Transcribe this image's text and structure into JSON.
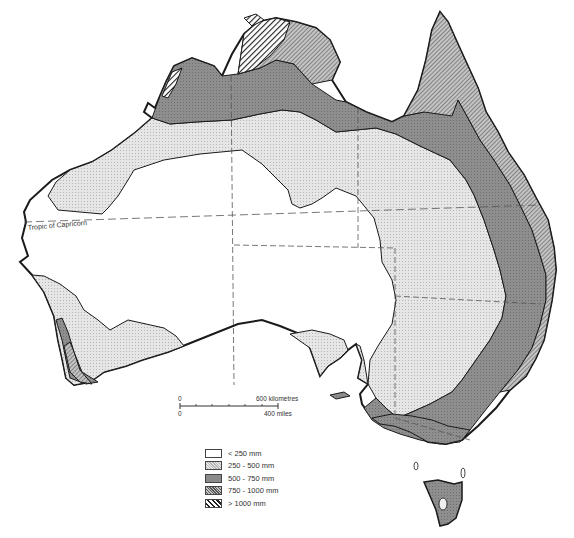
{
  "map": {
    "subject": "Australia annual rainfall",
    "tropic_label": "Tropic of Capricorn",
    "scale": {
      "zero_top": "0",
      "zero_bottom": "0",
      "km_label": "600 kilometres",
      "miles_label": "400 miles"
    },
    "legend": [
      {
        "label": "< 250 mm",
        "fill": "#ffffff",
        "pattern": "none"
      },
      {
        "label": "250 - 500 mm",
        "fill": "#e4e4e4",
        "pattern": "light-stipple"
      },
      {
        "label": "500 - 750 mm",
        "fill": "#8a8a8a",
        "pattern": "dark-stipple"
      },
      {
        "label": "750 - 1000 mm",
        "fill": "#a8a8a8",
        "pattern": "fine-hatch"
      },
      {
        "label": "> 1000 mm",
        "fill": "#2a2a2a",
        "pattern": "bold-hatch"
      }
    ]
  }
}
